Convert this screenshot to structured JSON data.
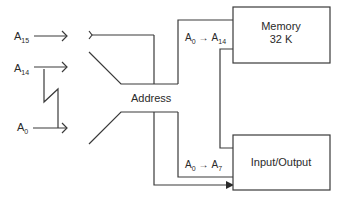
{
  "diagram": {
    "inputs": [
      {
        "base": "A",
        "sub": "15"
      },
      {
        "base": "A",
        "sub": "14"
      },
      {
        "base": "A",
        "sub": "0"
      }
    ],
    "bus_label": "Address",
    "blocks": {
      "memory": {
        "line1": "Memory",
        "line2": "32 K"
      },
      "io": {
        "label": "Input/Output"
      }
    },
    "connections": [
      {
        "from_base": "A",
        "from_sub": "0",
        "arrow": "→",
        "to_base": "A",
        "to_sub": "14",
        "target": "memory"
      },
      {
        "from_base": "A",
        "from_sub": "0",
        "arrow": "→",
        "to_base": "A",
        "to_sub": "7",
        "target": "io"
      }
    ],
    "colors": {
      "line": "#3a3a3a",
      "text": "#2a2a2a",
      "background": "#ffffff"
    }
  }
}
